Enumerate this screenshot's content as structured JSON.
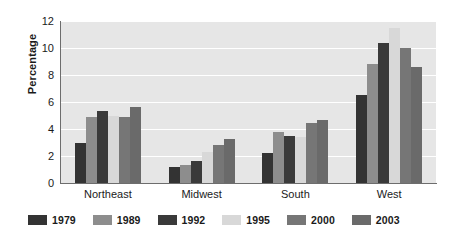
{
  "chart_data": {
    "type": "bar",
    "title": "",
    "subtitle": "",
    "xlabel": "",
    "ylabel": "Percentage",
    "ylim": [
      0,
      12
    ],
    "yticks": [
      0,
      2,
      4,
      6,
      8,
      10,
      12
    ],
    "ytick_labels": [
      "0",
      "2",
      "4",
      "6",
      "8",
      "10",
      "12"
    ],
    "grid": true,
    "grid_axis": "y",
    "legend_position": "bottom",
    "categories": [
      "Northeast",
      "Midwest",
      "South",
      "West"
    ],
    "series": [
      {
        "name": "1979",
        "color": "#333333",
        "values": [
          3.0,
          1.15,
          2.2,
          6.5
        ]
      },
      {
        "name": "1989",
        "color": "#8d8d8d",
        "values": [
          4.9,
          1.35,
          3.8,
          8.8
        ]
      },
      {
        "name": "1992",
        "color": "#3a3a3a",
        "values": [
          5.35,
          1.65,
          3.5,
          10.4
        ]
      },
      {
        "name": "1995",
        "color": "#d8d8d8",
        "values": [
          5.0,
          2.3,
          3.4,
          11.5
        ]
      },
      {
        "name": "2000",
        "color": "#767676",
        "values": [
          4.9,
          2.8,
          4.45,
          10.0
        ]
      },
      {
        "name": "2003",
        "color": "#6a6a6a",
        "values": [
          5.6,
          3.25,
          4.7,
          8.6
        ]
      }
    ],
    "plot_background": "#e6e6e6",
    "gridline_color": "#ffffff",
    "axis_color": "#6d6d6d",
    "text_color": "#1a1a1a"
  }
}
